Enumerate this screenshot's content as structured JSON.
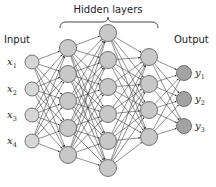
{
  "diagram": {
    "type": "feedforward-neural-network",
    "labels": {
      "input": "Input",
      "hidden": "Hidden layers",
      "output": "Output"
    },
    "colors": {
      "node_fill": "#c8c8c8",
      "output_fill": "#a3a3a3",
      "input_fill": "#d6d6d6",
      "node_stroke": "#555555",
      "edge": "#333333"
    },
    "layers": [
      {
        "name": "input",
        "x": 32,
        "ys": [
          62,
          89,
          115,
          141
        ],
        "labels": [
          {
            "base": "x",
            "sub": "1"
          },
          {
            "base": "x",
            "sub": "2"
          },
          {
            "base": "x",
            "sub": "3"
          },
          {
            "base": "x",
            "sub": "4"
          }
        ]
      },
      {
        "name": "hidden-1",
        "x": 68,
        "ys": [
          48,
          74,
          101,
          128,
          155
        ]
      },
      {
        "name": "hidden-2",
        "x": 108,
        "ys": [
          33,
          60,
          87,
          114,
          141,
          168
        ]
      },
      {
        "name": "hidden-3",
        "x": 149,
        "ys": [
          57,
          84,
          110,
          137
        ]
      },
      {
        "name": "output",
        "x": 184,
        "ys": [
          73,
          99,
          126
        ],
        "labels": [
          {
            "base": "y",
            "sub": "1"
          },
          {
            "base": "y",
            "sub": "2"
          },
          {
            "base": "y",
            "sub": "3"
          }
        ]
      }
    ]
  }
}
